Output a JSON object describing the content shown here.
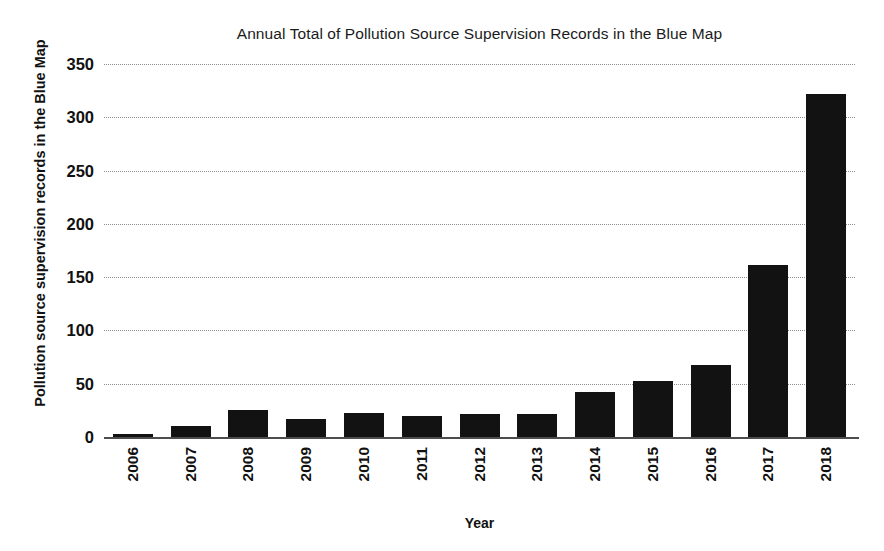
{
  "chart_data": {
    "type": "bar",
    "title": "Annual Total of Pollution Source Supervision Records in the Blue Map",
    "xlabel": "Year",
    "ylabel": "Pollution source supervision records in the Blue Map",
    "categories": [
      "2006",
      "2007",
      "2008",
      "2009",
      "2010",
      "2011",
      "2012",
      "2013",
      "2014",
      "2015",
      "2016",
      "2017",
      "2018"
    ],
    "values": [
      3,
      10,
      25,
      17,
      23,
      20,
      22,
      22,
      42,
      53,
      68,
      161,
      322
    ],
    "series": [
      {
        "name": "Pollution source supervision records",
        "values": [
          3,
          10,
          25,
          17,
          23,
          20,
          22,
          22,
          42,
          53,
          68,
          161,
          322
        ]
      }
    ],
    "ylim": [
      0,
      350
    ],
    "yticks": [
      0,
      50,
      100,
      150,
      200,
      250,
      300,
      350
    ],
    "ytick_labels": [
      "0",
      "50",
      "100",
      "150",
      "200",
      "250",
      "300",
      "350"
    ],
    "grid": true,
    "grid_axis": "y",
    "grid_style": "dotted",
    "legend": false,
    "bar_color": "#121212",
    "grid_color": "#8e8e8e",
    "axis_color": "#4d4d4d",
    "background": "#ffffff"
  }
}
